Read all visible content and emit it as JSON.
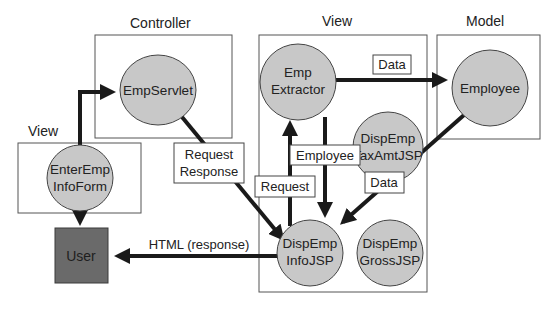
{
  "groups": {
    "controller": {
      "title": "Controller"
    },
    "view_left": {
      "title": "View"
    },
    "view_center": {
      "title": "View"
    },
    "model": {
      "title": "Model"
    }
  },
  "nodes": {
    "emp_servlet": {
      "lines": [
        "EmpServlet"
      ]
    },
    "enter_emp_info_form": {
      "lines": [
        "EnterEmp",
        "InfoForm"
      ]
    },
    "user": {
      "label": "User"
    },
    "emp_extractor": {
      "lines": [
        "Emp",
        "Extractor"
      ]
    },
    "disp_emp_tax_amt_jsp": {
      "lines": [
        "DispEmp",
        "TaxAmtJSP"
      ]
    },
    "disp_emp_info_jsp": {
      "lines": [
        "DispEmp",
        "InfoJSP"
      ]
    },
    "disp_emp_gross_jsp": {
      "lines": [
        "DispEmp",
        "GrossJSP"
      ]
    },
    "employee": {
      "lines": [
        "Employee"
      ]
    }
  },
  "edge_labels": {
    "extractor_to_employee": "Data",
    "extractor_to_info_jsp": "Employee",
    "info_jsp_to_extractor": "Request",
    "servlet_to_info_jsp": [
      "Request",
      "Response"
    ],
    "employee_to_info_jsp": "Data",
    "info_jsp_to_user": "HTML (response)"
  },
  "colors": {
    "node_fill": "#c8c8c8",
    "user_fill": "#6a6a6a",
    "arrow": "#1a1a1a"
  }
}
